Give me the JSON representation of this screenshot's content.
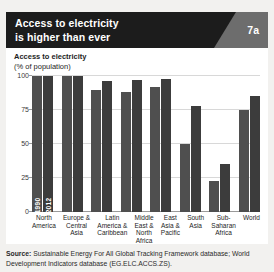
{
  "header": {
    "title_line1": "Access to electricity",
    "title_line2": "is higher than ever",
    "badge": "7a",
    "background_color": "#1c1c1c",
    "badge_panel_color": "#6d6d6d"
  },
  "chart_panel": {
    "axis_title": "Access to electricity",
    "axis_subtitle": "(% of population)",
    "series_label_1990": "1990",
    "series_label_2012": "2012"
  },
  "source": {
    "label": "Source:",
    "text": " Sustainable Energy For All Global Tracking Framework database; World Development Indicators database (EG.ELC.ACCS.ZS)."
  },
  "chart_data": {
    "type": "bar",
    "title": "Access to electricity",
    "subtitle": "(% of population)",
    "xlabel": "",
    "ylabel": "% of population",
    "ylim": [
      0,
      100
    ],
    "yticks": [
      0,
      25,
      50,
      75,
      100
    ],
    "ytick_labels": [
      "0",
      "25",
      "50",
      "75",
      "100"
    ],
    "grid": true,
    "legend": "in-bar",
    "bar_color_1990": "#4f4f4f",
    "bar_color_2012": "#3c3c3c",
    "categories": [
      "North America",
      "Europe & Central Asia",
      "Latin America & Caribbean",
      "Middle East & North Africa",
      "East Asia & Pacific",
      "South Asia",
      "Sub-Saharan Africa",
      "World"
    ],
    "category_lines": [
      [
        "North",
        "America"
      ],
      [
        "Europe &",
        "Central",
        "Asia"
      ],
      [
        "Latin",
        "America &",
        "Caribbean"
      ],
      [
        "Middle",
        "East &",
        "North",
        "Africa"
      ],
      [
        "East",
        "Asia &",
        "Pacific"
      ],
      [
        "South",
        "Asia"
      ],
      [
        "Sub-",
        "Saharan",
        "Africa"
      ],
      [
        "World"
      ]
    ],
    "series": [
      {
        "name": "1990",
        "values": [
          100,
          100,
          90,
          88,
          92,
          50,
          23,
          75
        ]
      },
      {
        "name": "2012",
        "values": [
          100,
          100,
          96,
          97,
          98,
          78,
          35,
          85
        ]
      }
    ]
  }
}
